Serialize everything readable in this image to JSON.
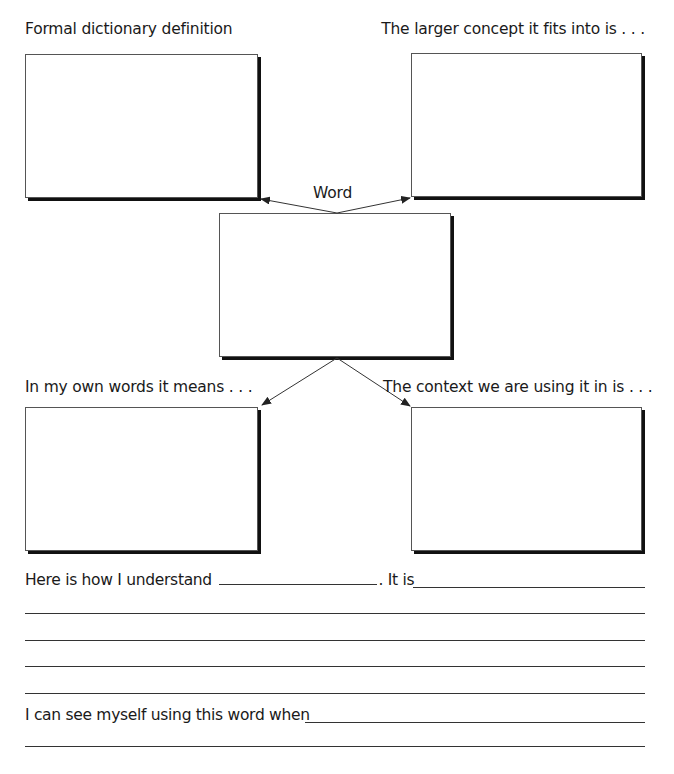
{
  "worksheet": {
    "center_label": "Word",
    "boxes": {
      "top_left": {
        "label": "Formal dictionary definition",
        "content": ""
      },
      "top_right": {
        "label": "The larger concept it fits into is . . .",
        "content": ""
      },
      "center": {
        "content": ""
      },
      "bottom_left": {
        "label": "In my own words it means . . .",
        "content": ""
      },
      "bottom_right": {
        "label": "The context we are using it in is . . .",
        "content": ""
      }
    },
    "prompts": {
      "understand_prefix": "Here is how I understand",
      "understand_middle": ". It is",
      "usage_prefix": "I can see myself using this word when"
    }
  }
}
